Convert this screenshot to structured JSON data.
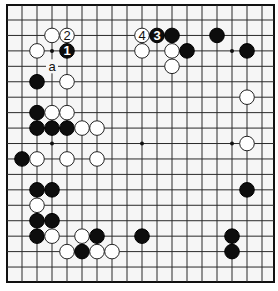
{
  "diagram": {
    "type": "go-board-partial",
    "grid": {
      "columns": 17,
      "rows": 17,
      "origin_x": 22,
      "origin_y": 20,
      "step_x": 15,
      "step_y": 15.44,
      "frame": {
        "x": 7,
        "y": 5,
        "width": 267,
        "height": 277
      },
      "stone_radius": 7.3
    },
    "colors": {
      "black": "#0d0d0d",
      "white": "#ffffff",
      "line": "#2a2a2a",
      "board": "#f6f6f6"
    },
    "hoshi": [
      [
        2,
        2
      ],
      [
        8,
        2
      ],
      [
        14,
        2
      ],
      [
        2,
        8
      ],
      [
        8,
        8
      ],
      [
        14,
        8
      ],
      [
        2,
        14
      ],
      [
        8,
        14
      ],
      [
        14,
        14
      ]
    ],
    "stones": [
      {
        "color": "white",
        "col": 2,
        "row": 1
      },
      {
        "color": "white",
        "col": 3,
        "row": 1,
        "label": "2"
      },
      {
        "color": "white",
        "col": 8,
        "row": 1,
        "label": "4"
      },
      {
        "color": "black",
        "col": 9,
        "row": 1,
        "label": "3"
      },
      {
        "color": "black",
        "col": 10,
        "row": 1
      },
      {
        "color": "black",
        "col": 13,
        "row": 1
      },
      {
        "color": "white",
        "col": 1,
        "row": 2
      },
      {
        "color": "black",
        "col": 3,
        "row": 2,
        "label": "1"
      },
      {
        "color": "white",
        "col": 8,
        "row": 2
      },
      {
        "color": "white",
        "col": 10,
        "row": 2
      },
      {
        "color": "black",
        "col": 11,
        "row": 2
      },
      {
        "color": "black",
        "col": 15,
        "row": 2
      },
      {
        "color": "white",
        "col": 10,
        "row": 3
      },
      {
        "color": "black",
        "col": 1,
        "row": 4
      },
      {
        "color": "white",
        "col": 3,
        "row": 4
      },
      {
        "color": "white",
        "col": 15,
        "row": 5
      },
      {
        "color": "black",
        "col": 1,
        "row": 6
      },
      {
        "color": "white",
        "col": 2,
        "row": 6
      },
      {
        "color": "white",
        "col": 3,
        "row": 6
      },
      {
        "color": "black",
        "col": 1,
        "row": 7
      },
      {
        "color": "black",
        "col": 2,
        "row": 7
      },
      {
        "color": "black",
        "col": 3,
        "row": 7
      },
      {
        "color": "white",
        "col": 4,
        "row": 7
      },
      {
        "color": "white",
        "col": 5,
        "row": 7
      },
      {
        "color": "white",
        "col": 15,
        "row": 8
      },
      {
        "color": "black",
        "col": 0,
        "row": 9
      },
      {
        "color": "white",
        "col": 1,
        "row": 9
      },
      {
        "color": "white",
        "col": 3,
        "row": 9
      },
      {
        "color": "white",
        "col": 5,
        "row": 9
      },
      {
        "color": "black",
        "col": 1,
        "row": 11
      },
      {
        "color": "black",
        "col": 2,
        "row": 11
      },
      {
        "color": "black",
        "col": 15,
        "row": 11
      },
      {
        "color": "white",
        "col": 1,
        "row": 12
      },
      {
        "color": "black",
        "col": 1,
        "row": 13
      },
      {
        "color": "black",
        "col": 2,
        "row": 13
      },
      {
        "color": "black",
        "col": 1,
        "row": 14
      },
      {
        "color": "white",
        "col": 2,
        "row": 14
      },
      {
        "color": "white",
        "col": 4,
        "row": 14
      },
      {
        "color": "black",
        "col": 5,
        "row": 14
      },
      {
        "color": "black",
        "col": 8,
        "row": 14
      },
      {
        "color": "black",
        "col": 14,
        "row": 14
      },
      {
        "color": "white",
        "col": 3,
        "row": 15
      },
      {
        "color": "black",
        "col": 4,
        "row": 15
      },
      {
        "color": "white",
        "col": 5,
        "row": 15
      },
      {
        "color": "white",
        "col": 6,
        "row": 15
      },
      {
        "color": "black",
        "col": 14,
        "row": 15
      }
    ],
    "markers": [
      {
        "text": "a",
        "col": 2,
        "row": 3
      }
    ]
  }
}
